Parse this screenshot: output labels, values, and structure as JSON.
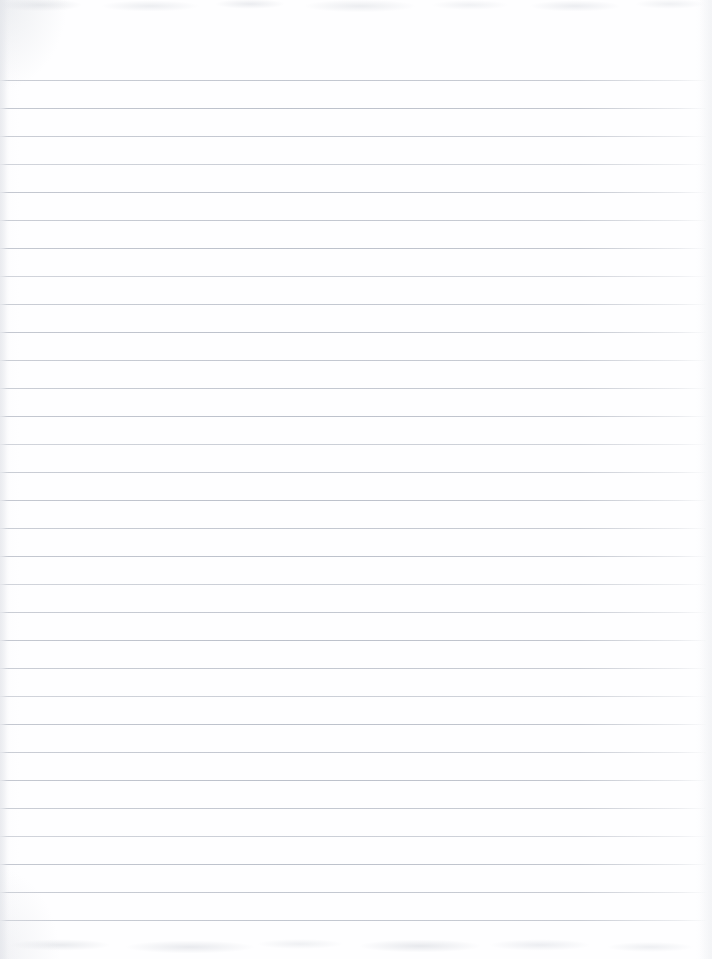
{
  "document": {
    "type": "scanned-lined-notebook-paper",
    "title": "Blank Ruled Notebook Page",
    "width": 712,
    "height": 959,
    "text_content": "",
    "has_handwriting": false,
    "has_printed_text": false,
    "has_margin_rule": false
  },
  "paper": {
    "background_color": "#fefeff",
    "edge_shadow_color": "#e4e6ea"
  },
  "ruling": {
    "line_color": "#c0c5cd",
    "line_thickness_px": 1,
    "line_spacing_px": 28,
    "first_line_y": 80,
    "last_line_y": 920,
    "line_count": 31,
    "line_left_x": 0,
    "line_right_x": 706,
    "line_weights": [
      "mid",
      "strong",
      "mid",
      "faint",
      "strong",
      "mid",
      "strong",
      "faint",
      "mid",
      "strong",
      "mid",
      "mid",
      "strong",
      "faint",
      "mid",
      "strong",
      "mid",
      "strong",
      "faint",
      "mid",
      "strong",
      "mid",
      "faint",
      "strong",
      "mid",
      "strong",
      "mid",
      "faint",
      "strong",
      "mid",
      "mid"
    ]
  },
  "scan_artifacts": {
    "top_noise_band_height": 26,
    "bottom_noise_band_height": 28,
    "noise_color": "#e6e8ec"
  }
}
